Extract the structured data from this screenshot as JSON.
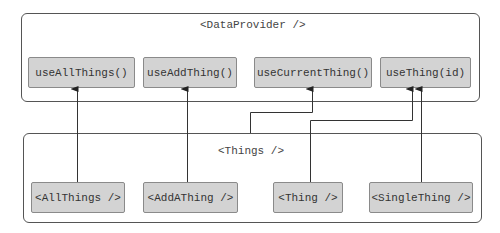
{
  "provider": {
    "title": "<DataProvider />",
    "hooks": [
      {
        "label": "useAllThings()"
      },
      {
        "label": "useAddThing()"
      },
      {
        "label": "useCurrentThing()"
      },
      {
        "label": "useThing(id)"
      }
    ]
  },
  "things": {
    "title": "<Things />",
    "components": [
      {
        "label": "<AllThings />"
      },
      {
        "label": "<AddAThing />"
      },
      {
        "label": "<Thing />"
      },
      {
        "label": "<SingleThing />"
      }
    ]
  },
  "edges": [
    {
      "from": "<AllThings />",
      "to": "useAllThings()"
    },
    {
      "from": "<AddAThing />",
      "to": "useAddThing()"
    },
    {
      "from": "<Things />",
      "to": "useCurrentThing()"
    },
    {
      "from": "<Thing />",
      "to": "useThing(id)"
    },
    {
      "from": "<SingleThing />",
      "to": "useThing(id)"
    }
  ]
}
